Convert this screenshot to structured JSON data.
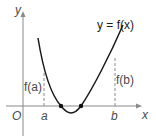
{
  "diagram": {
    "curve_label": "y = f(x)",
    "axis_x_label": "x",
    "axis_y_label": "y",
    "origin_label": "O",
    "a_label": "a",
    "b_label": "b",
    "fa_label": "f(a)",
    "fb_label": "f(b)",
    "colors": {
      "curve": "#1a1a1a",
      "axes": "#8a8a8a",
      "dashed": "#8a8a8a",
      "roots": "#111111"
    }
  }
}
